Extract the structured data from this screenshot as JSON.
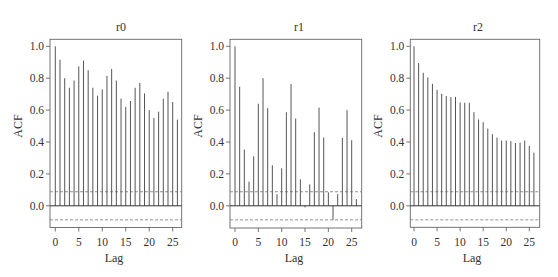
{
  "chart_data": [
    {
      "type": "bar",
      "subtype": "acf-stem",
      "title": "r0",
      "xlabel": "Lag",
      "ylabel": "ACF",
      "ylim": [
        -0.13,
        1.05
      ],
      "xlim": [
        -1,
        27
      ],
      "yticks": [
        "0.0",
        "0.2",
        "0.4",
        "0.6",
        "0.8",
        "1.0"
      ],
      "xticks": [
        "0",
        "5",
        "10",
        "15",
        "20",
        "25"
      ],
      "grid": false,
      "confidence_bound": 0.088,
      "x": [
        0,
        1,
        2,
        3,
        4,
        5,
        6,
        7,
        8,
        9,
        10,
        11,
        12,
        13,
        14,
        15,
        16,
        17,
        18,
        19,
        20,
        21,
        22,
        23,
        24,
        25,
        26
      ],
      "values": [
        1.0,
        0.916,
        0.8,
        0.74,
        0.785,
        0.874,
        0.91,
        0.85,
        0.74,
        0.69,
        0.73,
        0.815,
        0.858,
        0.785,
        0.672,
        0.62,
        0.657,
        0.74,
        0.77,
        0.705,
        0.6,
        0.55,
        0.59,
        0.672,
        0.715,
        0.65,
        0.54
      ]
    },
    {
      "type": "bar",
      "subtype": "acf-stem",
      "title": "r1",
      "xlabel": "Lag",
      "ylabel": "ACF",
      "ylim": [
        -0.13,
        1.05
      ],
      "xlim": [
        -1,
        27
      ],
      "yticks": [
        "0.0",
        "0.2",
        "0.4",
        "0.6",
        "0.8",
        "1.0"
      ],
      "xticks": [
        "0",
        "5",
        "10",
        "15",
        "20",
        "25"
      ],
      "grid": false,
      "confidence_bound": 0.088,
      "x": [
        0,
        1,
        2,
        3,
        4,
        5,
        6,
        7,
        8,
        9,
        10,
        11,
        12,
        13,
        14,
        15,
        16,
        17,
        18,
        19,
        20,
        21,
        22,
        23,
        24,
        25,
        26
      ],
      "values": [
        1.0,
        0.746,
        0.352,
        0.151,
        0.31,
        0.64,
        0.8,
        0.612,
        0.254,
        0.073,
        0.235,
        0.587,
        0.763,
        0.547,
        0.166,
        -0.01,
        0.134,
        0.461,
        0.616,
        0.428,
        0.084,
        -0.088,
        0.073,
        0.426,
        0.6,
        0.411,
        0.042
      ]
    },
    {
      "type": "bar",
      "subtype": "acf-stem",
      "title": "r2",
      "xlabel": "Lag",
      "ylabel": "ACF",
      "ylim": [
        -0.13,
        1.05
      ],
      "xlim": [
        -1,
        27
      ],
      "yticks": [
        "0.0",
        "0.2",
        "0.4",
        "0.6",
        "0.8",
        "1.0"
      ],
      "xticks": [
        "0",
        "5",
        "10",
        "15",
        "20",
        "25"
      ],
      "grid": false,
      "confidence_bound": 0.088,
      "x": [
        0,
        1,
        2,
        3,
        4,
        5,
        6,
        7,
        8,
        9,
        10,
        11,
        12,
        13,
        14,
        15,
        16,
        17,
        18,
        19,
        20,
        21,
        22,
        23,
        24,
        25,
        26
      ],
      "values": [
        1.0,
        0.895,
        0.834,
        0.805,
        0.765,
        0.727,
        0.702,
        0.688,
        0.681,
        0.683,
        0.648,
        0.646,
        0.646,
        0.587,
        0.541,
        0.524,
        0.484,
        0.449,
        0.428,
        0.409,
        0.409,
        0.405,
        0.394,
        0.396,
        0.409,
        0.375,
        0.333
      ]
    }
  ],
  "panels": [
    {
      "title": "r0",
      "xlabel": "Lag",
      "ylabel": "ACF"
    },
    {
      "title": "r1",
      "xlabel": "Lag",
      "ylabel": "ACF"
    },
    {
      "title": "r2",
      "xlabel": "Lag",
      "ylabel": "ACF"
    }
  ],
  "colors": {
    "bar": "#555555",
    "zero_line": "#333333",
    "bound_line": "#777777",
    "frame": "#666666",
    "text": "#333333"
  }
}
